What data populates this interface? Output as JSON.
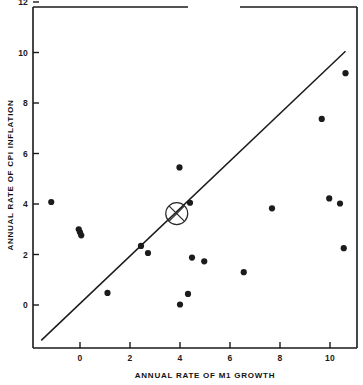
{
  "chart_data": {
    "type": "scatter",
    "title": "",
    "xlabel": "ANNUAL RATE OF M1 GROWTH",
    "ylabel": "ANNUAL RATE OF CPI INFLATION",
    "xlim": [
      -1.9,
      11.3
    ],
    "ylim": [
      -1.6,
      12.0
    ],
    "xticks": [
      0,
      2,
      4,
      6,
      8,
      10
    ],
    "xtick_labels": [
      "0",
      "2",
      "4",
      "6",
      "8",
      "10"
    ],
    "yticks": [
      0,
      2,
      4,
      6,
      8,
      10,
      12
    ],
    "ytick_labels": [
      "0",
      "2",
      "4",
      "6",
      "8",
      "10",
      "12"
    ],
    "grid": false,
    "legend": null,
    "points": [
      {
        "x": -1.15,
        "y": 4.08
      },
      {
        "x": -0.05,
        "y": 3.0
      },
      {
        "x": 0.0,
        "y": 2.88
      },
      {
        "x": 0.05,
        "y": 2.76
      },
      {
        "x": 1.1,
        "y": 0.48
      },
      {
        "x": 2.44,
        "y": 2.34
      },
      {
        "x": 2.72,
        "y": 2.06
      },
      {
        "x": 3.98,
        "y": 5.45
      },
      {
        "x": 4.0,
        "y": 0.02
      },
      {
        "x": 4.32,
        "y": 0.44
      },
      {
        "x": 4.4,
        "y": 4.05
      },
      {
        "x": 4.48,
        "y": 1.88
      },
      {
        "x": 4.97,
        "y": 1.73
      },
      {
        "x": 6.55,
        "y": 1.3
      },
      {
        "x": 7.68,
        "y": 3.83
      },
      {
        "x": 9.67,
        "y": 7.37
      },
      {
        "x": 9.97,
        "y": 4.22
      },
      {
        "x": 10.4,
        "y": 4.02
      },
      {
        "x": 10.55,
        "y": 2.25
      },
      {
        "x": 10.62,
        "y": 9.18
      }
    ],
    "reference_line": {
      "label": "45-degree line",
      "x1": -1.55,
      "y1": -1.4,
      "x2": 10.62,
      "y2": 10.05
    },
    "highlight_marker": {
      "label": "circled-x-mean-marker",
      "x": 3.87,
      "y": 3.62,
      "radius_px": 11
    },
    "colors": {
      "point": "#1b1b1b",
      "axis": "#1a1a1a",
      "line": "#1a1a1a",
      "background": "#ffffff"
    },
    "frame": {
      "top_border_gap": true,
      "note": "top frame border has a scan gap near the middle"
    }
  }
}
